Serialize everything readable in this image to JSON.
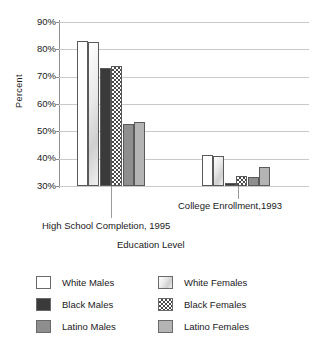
{
  "chart_data": {
    "type": "bar",
    "title": "",
    "xlabel": "Education Level",
    "ylabel": "Percent",
    "ylim": [
      30,
      90
    ],
    "ytick_labels": [
      "90%",
      "80%",
      "70%",
      "60%",
      "50%",
      "40%",
      "30%"
    ],
    "ytick_values": [
      90,
      80,
      70,
      60,
      50,
      40,
      30
    ],
    "grid": true,
    "legend_position": "bottom",
    "categories": [
      "High School Completion, 1995",
      "College Enrollment,1993"
    ],
    "series": [
      {
        "name": "White Males",
        "values": [
          83.0,
          41.5
        ],
        "fill": "white",
        "color": "#ffffff"
      },
      {
        "name": "White Females",
        "values": [
          82.8,
          41.0
        ],
        "fill": "light-gradient",
        "color": "#e0e0e0"
      },
      {
        "name": "Black Males",
        "values": [
          73.0,
          31.0
        ],
        "fill": "solid-dark",
        "color": "#3a3a3a"
      },
      {
        "name": "Black Females",
        "values": [
          73.8,
          33.5
        ],
        "fill": "checker",
        "color": "#4a4a4a"
      },
      {
        "name": "Latino Males",
        "values": [
          52.6,
          33.4
        ],
        "fill": "solid-gray",
        "color": "#8e8e8e"
      },
      {
        "name": "Latino Females",
        "values": [
          53.4,
          37.0
        ],
        "fill": "solid-light-gray",
        "color": "#b4b4b4"
      }
    ]
  },
  "axis": {
    "y_title": "Percent",
    "x_title": "Education Level",
    "y_ticks": [
      {
        "label": "90%",
        "value": 90
      },
      {
        "label": "80%",
        "value": 80
      },
      {
        "label": "70%",
        "value": 70
      },
      {
        "label": "60%",
        "value": 60
      },
      {
        "label": "50%",
        "value": 50
      },
      {
        "label": "40%",
        "value": 40
      },
      {
        "label": "30%",
        "value": 30
      }
    ],
    "category_labels": [
      "High School Completion, 1995",
      "College Enrollment,1993"
    ]
  },
  "legend": {
    "left_column": [
      {
        "label": "White Males",
        "swatch": "white-males"
      },
      {
        "label": "Black Males",
        "swatch": "black-males"
      },
      {
        "label": "Latino Males",
        "swatch": "latino-males"
      }
    ],
    "right_column": [
      {
        "label": "White Females",
        "swatch": "white-females"
      },
      {
        "label": "Black Females",
        "swatch": "black-females"
      },
      {
        "label": "Latino Females",
        "swatch": "latino-females"
      }
    ]
  }
}
